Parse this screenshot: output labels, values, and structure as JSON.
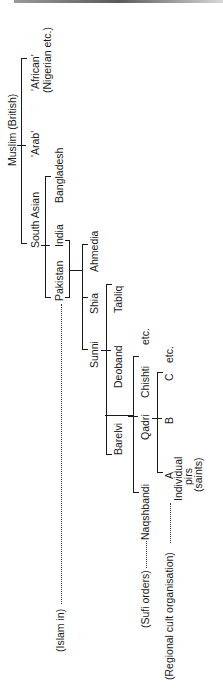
{
  "diagram": {
    "orientation": "rotated -90deg",
    "root": "Muslim (British)",
    "nodes": {
      "root": "Muslim (British)",
      "african_1": "'African'",
      "african_2": "(Nigerian etc.)",
      "arab": "'Arab'",
      "south_asian": "South Asian",
      "bangladesh": "Bangladesh",
      "india": "India",
      "pakistan": "Pakistan",
      "ahmedia": "Ahmedia",
      "shia": "Shia",
      "sunni": "Sunni",
      "tabliq": "Tabliq",
      "deoband": "Deoband",
      "barelvi": "Barelvi",
      "chishti": "Chishti",
      "chishti_etc": "etc.",
      "qadri": "Qadri",
      "naqshbandi": "Naqshbandi",
      "c": "C",
      "c_etc": "etc.",
      "b": "B",
      "a": "A",
      "pirs_1": "Individual",
      "pirs_2": "pirs",
      "pirs_3": "(saints)"
    },
    "level_labels": {
      "islam_in": "(Islam in)",
      "sufi_orders": "(Sufi orders)",
      "regional_cult": "(Regional cult organisation)"
    },
    "tree": {
      "label": "Muslim (British)",
      "children": [
        {
          "label": "'African' (Nigerian etc.)"
        },
        {
          "label": "'Arab'"
        },
        {
          "label": "South Asian",
          "children": [
            {
              "label": "Bangladesh"
            },
            {
              "label": "India"
            },
            {
              "label": "Pakistan",
              "children": [
                {
                  "label": "Ahmedia"
                },
                {
                  "label": "Shia"
                },
                {
                  "label": "Sunni",
                  "children": [
                    {
                      "label": "Tabliq"
                    },
                    {
                      "label": "Deoband"
                    },
                    {
                      "label": "Barelvi",
                      "children": [
                        {
                          "label": "Chishti etc."
                        },
                        {
                          "label": "Qadri",
                          "children": [
                            {
                              "label": "C etc."
                            },
                            {
                              "label": "B"
                            },
                            {
                              "label": "A Individual pirs (saints)"
                            }
                          ]
                        },
                        {
                          "label": "Naqshbandi"
                        }
                      ]
                    }
                  ]
                }
              ]
            }
          ]
        }
      ]
    }
  }
}
